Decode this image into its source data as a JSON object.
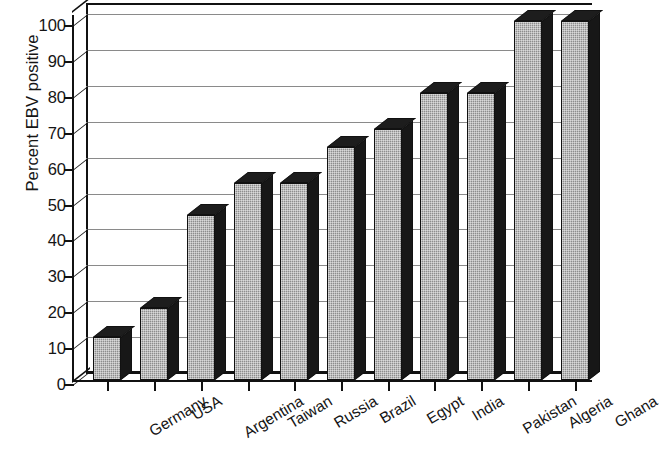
{
  "chart_data": {
    "type": "bar",
    "title": "",
    "subtitle": "",
    "xlabel": "",
    "ylabel": "Percent EBV positive",
    "ylim": [
      0,
      100
    ],
    "ytick_step": 10,
    "yticks": [
      0,
      10,
      20,
      30,
      40,
      50,
      60,
      70,
      80,
      90,
      100
    ],
    "ytick_labels": [
      "0",
      "10",
      "20",
      "30",
      "40",
      "50",
      "60",
      "70",
      "80",
      "90",
      "100"
    ],
    "grid": "horizontal",
    "legend": "none",
    "style": "3d-column",
    "bar_color": "#8d8d8d",
    "bar_edge_color": "#111111",
    "bar_shadow_color": "#1a1a1a",
    "gridline_color": "#8a8a8a",
    "axis_color": "#111111",
    "background_color": "#ffffff",
    "categories": [
      "Germany",
      "USA",
      "Argentina",
      "Taiwan",
      "Russia",
      "Brazil",
      "Egypt",
      "India",
      "Pakistan",
      "Algeria",
      "Ghana"
    ],
    "values": [
      12,
      20,
      46,
      55,
      55,
      65,
      70,
      80,
      80,
      100,
      100
    ],
    "series": [
      {
        "name": "Percent EBV positive",
        "values": [
          12,
          20,
          46,
          55,
          55,
          65,
          70,
          80,
          80,
          100,
          100
        ]
      }
    ]
  }
}
